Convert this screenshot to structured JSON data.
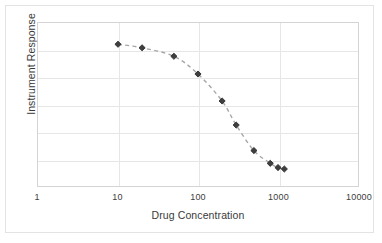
{
  "chart_data": {
    "type": "scatter",
    "title": "",
    "xlabel": "Drug Concentration",
    "ylabel": "Instrument Response",
    "xscale": "log",
    "yscale": "linear",
    "xlim": [
      1,
      10000
    ],
    "ylim": [
      0,
      1.15
    ],
    "xticks": [
      1,
      10,
      100,
      1000,
      10000
    ],
    "xticklabels": [
      "1",
      "10",
      "100",
      "1000",
      "10000"
    ],
    "yticklabels": [],
    "grid": "both",
    "legend": "none",
    "marker": "diamond",
    "marker_color": "#3f3f3f",
    "line_style": "dashed",
    "line_color": "#a6a6a6",
    "x": [
      10,
      20,
      50,
      100,
      200,
      300,
      500,
      800,
      1000,
      1200
    ],
    "y": [
      1.0,
      0.975,
      0.915,
      0.79,
      0.6,
      0.43,
      0.25,
      0.16,
      0.13,
      0.12
    ],
    "series": [
      {
        "name": "Dose response",
        "x": [
          10,
          20,
          50,
          100,
          200,
          300,
          500,
          800,
          1000,
          1200
        ],
        "values": [
          1.0,
          0.975,
          0.915,
          0.79,
          0.6,
          0.43,
          0.25,
          0.16,
          0.13,
          0.12
        ]
      }
    ],
    "annotations": []
  },
  "axis": {
    "x_title": "Drug Concentration",
    "y_title": "Instrument Response",
    "x_tick_labels": [
      "1",
      "10",
      "100",
      "1000",
      "10000"
    ]
  },
  "colors": {
    "grid": "#e6e6e6",
    "frame": "#d4d4d4",
    "card_border": "#e3e3e3",
    "marker": "#3f3f3f",
    "curve": "#a6a6a6",
    "text": "#3a3a3a",
    "background": "#ffffff"
  }
}
